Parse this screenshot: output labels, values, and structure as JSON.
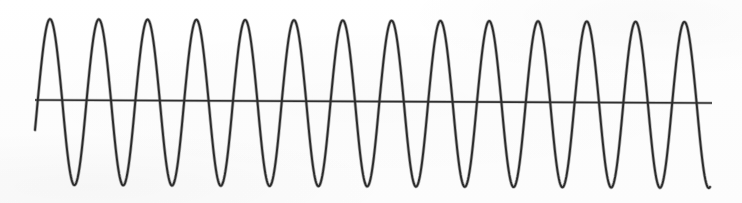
{
  "figure": {
    "title": "",
    "subtitle": "",
    "background_color": "#fefefe",
    "trace_color": "#2b2b2b",
    "baseline_color": "#303030",
    "width_px": 742,
    "height_px": 203
  },
  "chart_data": {
    "type": "line",
    "title": "",
    "subtitle": "",
    "xlabel": "",
    "ylabel": "",
    "xlim": [
      0,
      742
    ],
    "ylim": [
      203,
      0
    ],
    "grid": false,
    "legend": "none",
    "axis_ticks_visible": false,
    "tick_labels_x": [],
    "tick_labels_y": [],
    "annotations": [],
    "waveform": {
      "shape": "sinusoid",
      "cycles": 14,
      "peak_count": 14,
      "trough_count": 13,
      "start_x_px": 35,
      "end_x_px": 710,
      "first_peak_x_px": 50,
      "last_peak_x_px": 685,
      "period_px": 48.8,
      "peak_y_px": 19,
      "trough_y_px": 185,
      "baseline_y_left_px": 100,
      "baseline_y_right_px": 103,
      "amplitude_up_px": 81,
      "amplitude_down_px": 85,
      "samples_per_cycle": 72
    },
    "baseline": {
      "name": "zero-line",
      "x_start_px": 35,
      "x_end_px": 712,
      "y_start_px": 100,
      "y_end_px": 103,
      "slope_px_per_px": 0.0044
    },
    "series": [
      {
        "name": "trace",
        "description": "continuous oscillating trace, 14 full cycles left to right",
        "color": "#2b2b2b"
      },
      {
        "name": "baseline",
        "description": "near-horizontal reference line spanning the trace, slightly sloped downward to the right",
        "color": "#303030"
      }
    ]
  }
}
